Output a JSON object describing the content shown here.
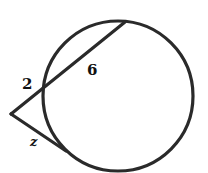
{
  "diagram": {
    "type": "circle with secant and tangent from external point",
    "stroke_color": "#2a2a2a",
    "background": "#ffffff",
    "labels": {
      "external_secant_segment": "2",
      "internal_secant_segment": "6",
      "tangent_segment": "z"
    }
  }
}
